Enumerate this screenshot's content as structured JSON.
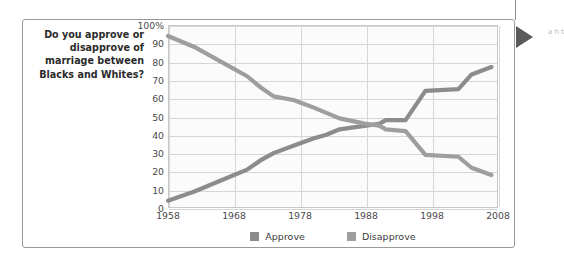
{
  "question": "Do you approve or disapprove of marriage between Blacks and Whites?",
  "edge_fragment": "a h t",
  "legend": {
    "approve": {
      "label": "Approve",
      "color": "#8c8c8c"
    },
    "disapprove": {
      "label": "Disapprove",
      "color": "#9e9e9e"
    }
  },
  "chart_data": {
    "type": "line",
    "title": "Do you approve or disapprove of marriage between Blacks and Whites?",
    "xlabel": "",
    "ylabel": "",
    "xlim": [
      1958,
      2008
    ],
    "ylim": [
      0,
      100
    ],
    "grid": true,
    "legend_position": "bottom",
    "x_ticks": [
      "1958",
      "1968",
      "1978",
      "1988",
      "1998",
      "2008"
    ],
    "y_ticks": [
      "0",
      "10",
      "20",
      "30",
      "40",
      "50",
      "60",
      "70",
      "80",
      "90",
      "100%"
    ],
    "x": [
      1958,
      1962,
      1966,
      1970,
      1972,
      1974,
      1977,
      1980,
      1982,
      1984,
      1988,
      1990,
      1991,
      1994,
      1997,
      2002,
      2004,
      2007
    ],
    "series": [
      {
        "name": "Approve",
        "color": "#8c8c8c",
        "values": [
          4,
          9,
          15,
          21,
          26,
          30,
          34,
          38,
          40,
          43,
          45,
          46,
          48,
          48,
          64,
          65,
          73,
          77
        ]
      },
      {
        "name": "Disapprove",
        "color": "#9e9e9e",
        "values": [
          94,
          88,
          80,
          72,
          66,
          61,
          59,
          55,
          52,
          49,
          46,
          45,
          43,
          42,
          29,
          28,
          22,
          18
        ]
      }
    ]
  }
}
